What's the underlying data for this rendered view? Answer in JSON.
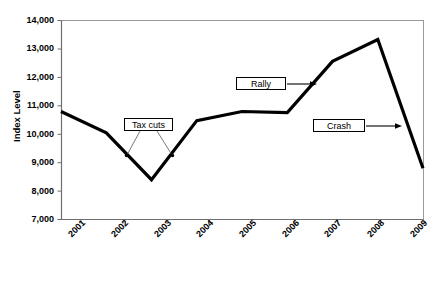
{
  "chart_data": {
    "type": "line",
    "title": "",
    "xlabel": "",
    "ylabel": "Index Level",
    "x": [
      2001,
      2002,
      2003,
      2004,
      2005,
      2006,
      2007,
      2008,
      2009
    ],
    "categories": [
      "2001",
      "2002",
      "2003",
      "2004",
      "2005",
      "2006",
      "2007",
      "2008",
      "2009"
    ],
    "values": [
      10800,
      10050,
      8400,
      10480,
      10800,
      10760,
      12560,
      13330,
      8800
    ],
    "series": [
      {
        "name": "Index Level",
        "values": [
          10800,
          10050,
          8400,
          10480,
          10800,
          10760,
          12560,
          13330,
          8800
        ]
      }
    ],
    "ylim": [
      7000,
      14000
    ],
    "ytick_values": [
      7000,
      8000,
      9000,
      10000,
      11000,
      12000,
      13000,
      14000
    ],
    "ytick_labels": [
      "7,000",
      "8,000",
      "9,000",
      "10,000",
      "11,000",
      "12,000",
      "13,000",
      "14,000"
    ],
    "xtick_labels": [
      "2001",
      "2002",
      "2003",
      "2004",
      "2005",
      "2006",
      "2007",
      "2008",
      "2009"
    ],
    "grid": false,
    "legend": false,
    "legend_position": "none",
    "line_color": "#000000",
    "plot_border_color": "#9a9a9a",
    "background_color": "#ffffff",
    "annotations": [
      {
        "label": "Tax cuts",
        "style": "box-with-two-leader-lines",
        "points_to": [
          "2002",
          "2003-2004 midpoint"
        ]
      },
      {
        "label": "Rally",
        "style": "box-with-arrow-right",
        "points_to": "2006-2007 rise"
      },
      {
        "label": "Crash",
        "style": "box-with-arrow-right",
        "points_to": "2008-2009 decline"
      }
    ]
  },
  "axes": {
    "y_title": "Index Level",
    "y_ticks": [
      "14,000",
      "13,000",
      "12,000",
      "11,000",
      "10,000",
      "9,000",
      "8,000",
      "7,000"
    ],
    "x_ticks": [
      "2001",
      "2002",
      "2003",
      "2004",
      "2005",
      "2006",
      "2007",
      "2008",
      "2009"
    ]
  },
  "annotations": {
    "tax_cuts": "Tax cuts",
    "rally": "Rally",
    "crash": "Crash"
  }
}
